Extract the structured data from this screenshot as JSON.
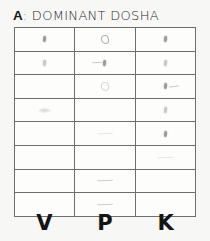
{
  "background_color": "#f7f7f6",
  "title": {
    "letter": "A",
    "text": ": DOMINANT DOSHA",
    "full": "A: DOMINANT DOSHA"
  },
  "table": {
    "row_count": 8,
    "column_count": 3,
    "border_color": "#6e6e6e",
    "cell_fill": "#fdfdfc",
    "columns": [
      {
        "key": "V",
        "label": "V",
        "name": "Vata"
      },
      {
        "key": "P",
        "label": "P",
        "name": "Pitta"
      },
      {
        "key": "K",
        "label": "K",
        "name": "Kapha"
      }
    ],
    "rows": [
      {
        "index": 1,
        "cells": [
          {
            "column": "V",
            "mark": "dot"
          },
          {
            "column": "P",
            "mark": "loop"
          },
          {
            "column": "K",
            "mark": "dot"
          }
        ]
      },
      {
        "index": 2,
        "cells": [
          {
            "column": "V",
            "mark": "dot-soft"
          },
          {
            "column": "P",
            "mark": "dot-tail-left"
          },
          {
            "column": "K",
            "mark": "dot-soft"
          }
        ]
      },
      {
        "index": 3,
        "cells": [
          {
            "column": "V",
            "mark": "none"
          },
          {
            "column": "P",
            "mark": "loop-soft"
          },
          {
            "column": "K",
            "mark": "dot-tail-right"
          }
        ]
      },
      {
        "index": 4,
        "cells": [
          {
            "column": "V",
            "mark": "smudge"
          },
          {
            "column": "P",
            "mark": "none"
          },
          {
            "column": "K",
            "mark": "dot-soft"
          }
        ]
      },
      {
        "index": 5,
        "cells": [
          {
            "column": "V",
            "mark": "none"
          },
          {
            "column": "P",
            "mark": "dash-faint"
          },
          {
            "column": "K",
            "mark": "dot"
          }
        ]
      },
      {
        "index": 6,
        "cells": [
          {
            "column": "V",
            "mark": "none"
          },
          {
            "column": "P",
            "mark": "none"
          },
          {
            "column": "K",
            "mark": "dash-faint"
          }
        ]
      },
      {
        "index": 7,
        "cells": [
          {
            "column": "V",
            "mark": "none"
          },
          {
            "column": "P",
            "mark": "dash"
          },
          {
            "column": "K",
            "mark": "none"
          }
        ]
      },
      {
        "index": 8,
        "cells": [
          {
            "column": "V",
            "mark": "none"
          },
          {
            "column": "P",
            "mark": "dash"
          },
          {
            "column": "K",
            "mark": "none"
          }
        ]
      }
    ]
  },
  "column_labels": [
    "V",
    "P",
    "K"
  ]
}
